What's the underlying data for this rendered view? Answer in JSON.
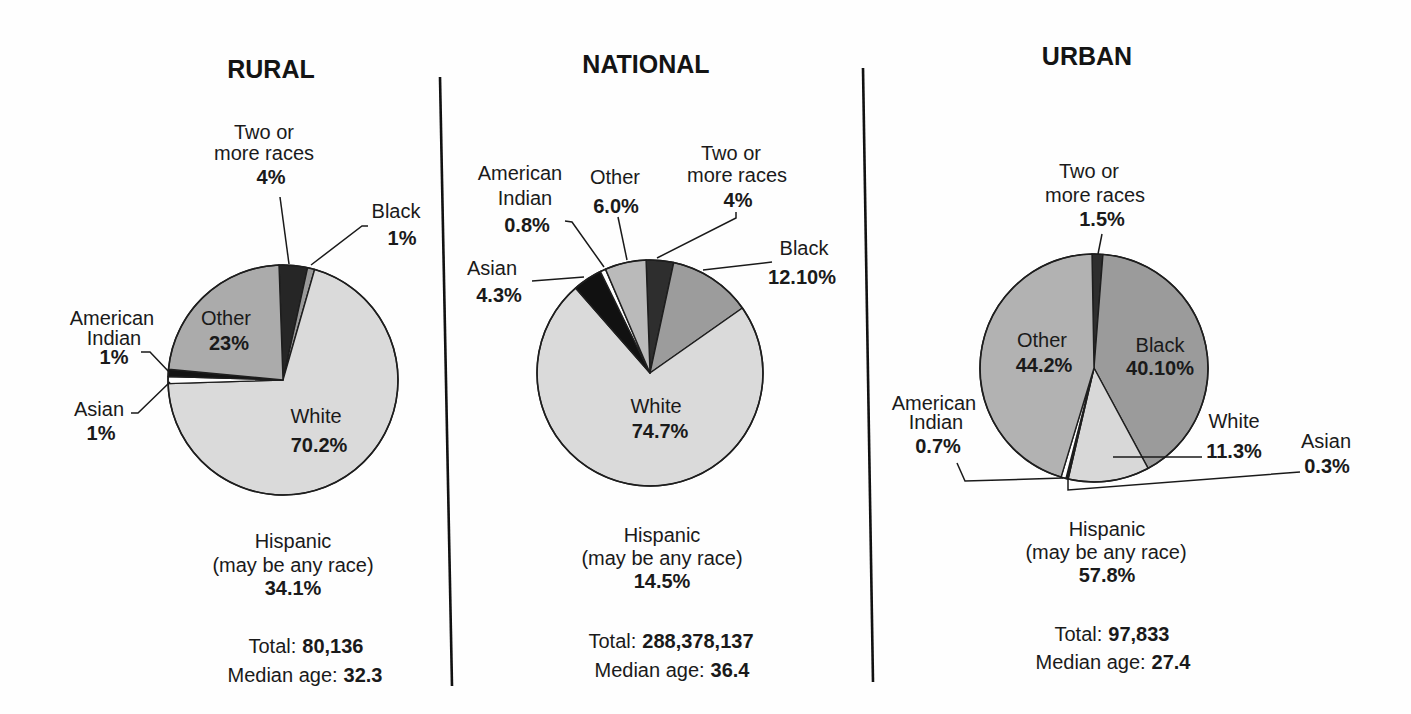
{
  "chart_data": [
    {
      "type": "pie",
      "title": "RURAL",
      "slices": [
        {
          "label": "Two or more races",
          "label_lines": [
            "Two or",
            "more races"
          ],
          "value": 4,
          "display": "4%",
          "color": "#262626"
        },
        {
          "label": "Black",
          "label_lines": [
            "Black"
          ],
          "value": 1,
          "display": "1%",
          "color": "#9a9a9a"
        },
        {
          "label": "White",
          "label_lines": [
            "White"
          ],
          "value": 70.2,
          "display": "70.2%",
          "color": "#dadada"
        },
        {
          "label": "Asian",
          "label_lines": [
            "Asian"
          ],
          "value": 1,
          "display": "1%",
          "color": "#ffffff"
        },
        {
          "label": "American Indian",
          "label_lines": [
            "American",
            "Indian"
          ],
          "value": 1,
          "display": "1%",
          "color": "#141414"
        },
        {
          "label": "Other",
          "label_lines": [
            "Other"
          ],
          "value": 23,
          "display": "23%",
          "color": "#ababab"
        }
      ],
      "hispanic": {
        "label_lines": [
          "Hispanic",
          "(may be any race)"
        ],
        "value": 34.1,
        "display": "34.1%"
      },
      "total": {
        "label": "Total:",
        "value": "80,136"
      },
      "median_age": {
        "label": "Median age:",
        "value": "32.3"
      }
    },
    {
      "type": "pie",
      "title": "NATIONAL",
      "slices": [
        {
          "label": "Two or more races",
          "label_lines": [
            "Two or",
            "more races"
          ],
          "value": 4,
          "display": "4%",
          "color": "#2e2e2e"
        },
        {
          "label": "Black",
          "label_lines": [
            "Black"
          ],
          "value": 12.1,
          "display": "12.10%",
          "color": "#9c9c9c"
        },
        {
          "label": "White",
          "label_lines": [
            "White"
          ],
          "value": 74.7,
          "display": "74.7%",
          "color": "#dadada"
        },
        {
          "label": "Asian",
          "label_lines": [
            "Asian"
          ],
          "value": 4.3,
          "display": "4.3%",
          "color": "#111111"
        },
        {
          "label": "American Indian",
          "label_lines": [
            "American",
            "Indian"
          ],
          "value": 0.8,
          "display": "0.8%",
          "color": "#ffffff"
        },
        {
          "label": "Other",
          "label_lines": [
            "Other"
          ],
          "value": 6.0,
          "display": "6.0%",
          "color": "#bababa"
        }
      ],
      "hispanic": {
        "label_lines": [
          "Hispanic",
          "(may be any race)"
        ],
        "value": 14.5,
        "display": "14.5%"
      },
      "total": {
        "label": "Total:",
        "value": "288,378,137"
      },
      "median_age": {
        "label": "Median age:",
        "value": "36.4"
      }
    },
    {
      "type": "pie",
      "title": "URBAN",
      "slices": [
        {
          "label": "Two or more races",
          "label_lines": [
            "Two or",
            "more races"
          ],
          "value": 1.5,
          "display": "1.5%",
          "color": "#2e2e2e"
        },
        {
          "label": "Black",
          "label_lines": [
            "Black"
          ],
          "value": 40.1,
          "display": "40.10%",
          "color": "#9b9b9b"
        },
        {
          "label": "White",
          "label_lines": [
            "White"
          ],
          "value": 11.3,
          "display": "11.3%",
          "color": "#d8d8d8"
        },
        {
          "label": "Asian",
          "label_lines": [
            "Asian"
          ],
          "value": 0.3,
          "display": "0.3%",
          "color": "#1a1a1a"
        },
        {
          "label": "American Indian",
          "label_lines": [
            "American",
            "Indian"
          ],
          "value": 0.7,
          "display": "0.7%",
          "color": "#ffffff"
        },
        {
          "label": "Other",
          "label_lines": [
            "Other"
          ],
          "value": 44.2,
          "display": "44.2%",
          "color": "#b2b2b2"
        }
      ],
      "hispanic": {
        "label_lines": [
          "Hispanic",
          "(may be any race)"
        ],
        "value": 57.8,
        "display": "57.8%"
      },
      "total": {
        "label": "Total:",
        "value": "97,833"
      },
      "median_age": {
        "label": "Median age:",
        "value": "27.4"
      }
    }
  ]
}
